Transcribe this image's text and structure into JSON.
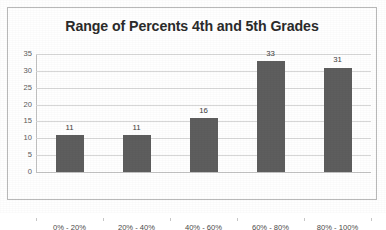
{
  "chart_data": {
    "type": "bar",
    "title": "Range of Percents 4th and 5th Grades",
    "xlabel": "",
    "ylabel": "",
    "categories": [
      "0% - 20%",
      "20% - 40%",
      "40% - 60%",
      "60% - 80%",
      "80% - 100%"
    ],
    "values": [
      11,
      11,
      16,
      33,
      31
    ],
    "value_labels": [
      "11",
      "11",
      "16",
      "33",
      "31"
    ],
    "ylim": [
      0,
      35
    ],
    "ytick_step": 5,
    "yticks": [
      35,
      30,
      25,
      20,
      15,
      10,
      5,
      0
    ],
    "ytick_labels": [
      "35",
      "30",
      "25",
      "20",
      "15",
      "10",
      "5",
      "0"
    ],
    "grid": "horizontal",
    "legend": "none",
    "colors": {
      "bar": "#5e5e5e",
      "gridline": "#d7d7d7",
      "axis_line": "#c2c2c2",
      "title_text": "#2b2b2b",
      "tick_text": "#5a5a5a",
      "category_text": "#4a4a4a",
      "value_text": "#3d3d3d",
      "frame_border": "#b9b9b9",
      "plot_background": "#ffffff"
    }
  }
}
